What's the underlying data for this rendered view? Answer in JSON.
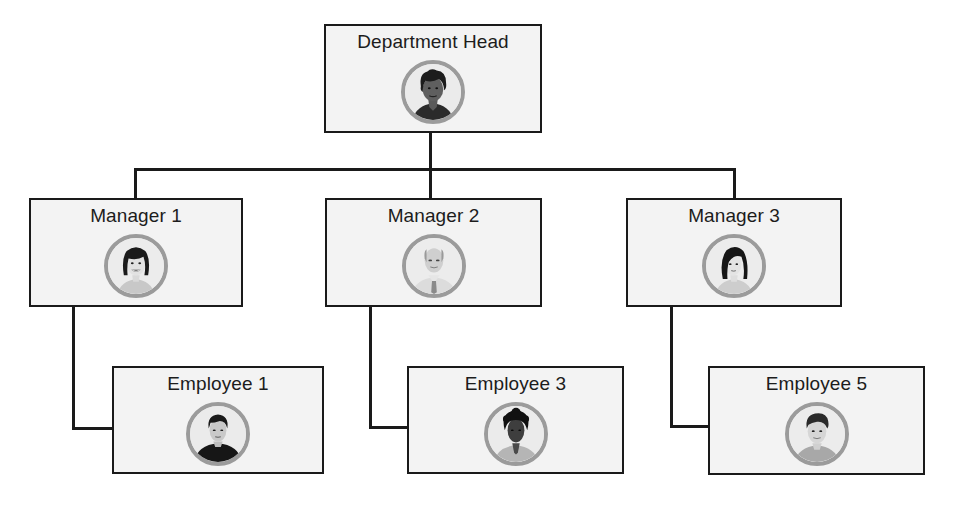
{
  "diagram": {
    "type": "org-chart",
    "colors": {
      "line": "#1a1a1a",
      "box_fill": "#f3f3f3",
      "box_border": "#1a1a1a",
      "avatar_ring": "#9b9b9b",
      "text": "#1c1c1c"
    },
    "head": {
      "title": "Department Head",
      "avatar": "woman-short-curly-hair-avatar-icon"
    },
    "managers": [
      {
        "title": "Manager 1",
        "avatar": "woman-bob-hair-avatar-icon",
        "reports": [
          {
            "title": "Employee 1",
            "avatar": "man-dark-shirt-avatar-icon"
          }
        ]
      },
      {
        "title": "Manager 2",
        "avatar": "bald-man-tie-avatar-icon",
        "reports": [
          {
            "title": "Employee 3",
            "avatar": "man-curly-hair-avatar-icon"
          }
        ]
      },
      {
        "title": "Manager 3",
        "avatar": "woman-long-hair-avatar-icon",
        "reports": [
          {
            "title": "Employee 5",
            "avatar": "young-man-avatar-icon"
          }
        ]
      }
    ]
  }
}
